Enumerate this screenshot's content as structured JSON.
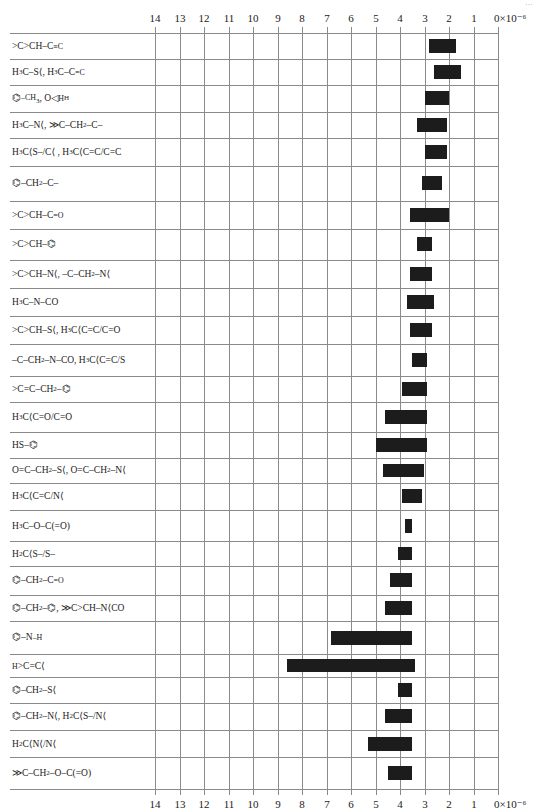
{
  "chart_data": {
    "type": "bar",
    "orientation": "horizontal-range",
    "title": "",
    "xlabel": "×10⁻⁶ (chemical shift scale, reversed)",
    "ylabel": "",
    "xlim": [
      14,
      0
    ],
    "x_unit": "×10⁻⁶",
    "grid": true,
    "ticks": [
      "14",
      "13",
      "12",
      "11",
      "10",
      "9",
      "8",
      "7",
      "6",
      "5",
      "4",
      "3",
      "2",
      "1",
      "0×10⁻⁶"
    ],
    "tick_values": [
      14,
      13,
      12,
      11,
      10,
      9,
      8,
      7,
      6,
      5,
      4,
      3,
      2,
      1,
      0
    ],
    "categories": [
      "(CH3)2CH–C=C",
      "H3C–S, H3C–C=C",
      "C6H5–CH3, epoxide CH2",
      "H3C–N, C=C–CH2–C",
      "H3C–S–C, H3C–C=C",
      "C6H5–CH2–C",
      "(CH3)2CH–C=O",
      "(CH3)2CH–C6H5",
      "(CH3)2CH–N, C–CH2–N",
      "H3C–N–CO",
      "(CH3)2CH–S, H3C–C(=C)–C=O",
      "C–CH2–N–CO, H3C–C(=C)–S",
      "C=C–CH2–C6H5",
      "H3C–C(=O)–C=O",
      "HS–C6H5",
      "O=C–CH2–S, O=C–CH2–N",
      "H3C–C(=C)–N",
      "H3C–O–C(=O)",
      "H2C(S–)(S–)",
      "C6H5–CH2–C=O",
      "C6H5–CH2–C6H5, (CH3)2CH–N–CO",
      "C6H5–NH",
      "H–C=C",
      "C6H5–CH2–S",
      "C6H5–CH2–N, H2C(S)(N)",
      "H2C(N)(N)",
      "C–CH2–O–C(=O)"
    ],
    "ranges": [
      [
        2.8,
        1.7
      ],
      [
        2.6,
        1.5
      ],
      [
        3.0,
        2.0
      ],
      [
        3.3,
        2.1
      ],
      [
        3.0,
        2.1
      ],
      [
        3.1,
        2.3
      ],
      [
        3.6,
        2.0
      ],
      [
        3.3,
        2.7
      ],
      [
        3.6,
        2.7
      ],
      [
        3.7,
        2.6
      ],
      [
        3.6,
        2.7
      ],
      [
        3.5,
        2.9
      ],
      [
        3.9,
        2.9
      ],
      [
        4.6,
        2.9
      ],
      [
        5.0,
        2.9
      ],
      [
        4.7,
        3.0
      ],
      [
        3.9,
        3.1
      ],
      [
        3.8,
        3.5
      ],
      [
        4.1,
        3.5
      ],
      [
        4.4,
        3.5
      ],
      [
        4.6,
        3.5
      ],
      [
        6.8,
        3.5
      ],
      [
        8.6,
        3.4
      ],
      [
        4.1,
        3.5
      ],
      [
        4.6,
        3.5
      ],
      [
        5.3,
        3.5
      ],
      [
        4.5,
        3.5
      ]
    ],
    "row_labels_html": [
      "&gt;C&gt;CH–C<sup>≡C</sup>",
      "H<sub>3</sub>C–S⟨, H<sub>3</sub>C–C<sup>=C</sup>",
      "⌬<sup>–CH<sub>3</sub></sup>, O◁<sup>H</sup><sub>H</sub>",
      "H<sub>3</sub>C–N⟨, ≫C–CH<sub>2</sub>–C–",
      "H<sub>3</sub>C⟨S–/C⟨ , H<sub>3</sub>C⟨C=C/C=C",
      "⌬–CH<sub>2</sub>–C–",
      "&gt;C&gt;CH–C<sup>=O</sup>",
      "&gt;C&gt;CH–⌬",
      "&gt;C&gt;CH–N⟨, –C–CH<sub>2</sub>–N⟨",
      "H<sub>3</sub>C–N–CO",
      "&gt;C&gt;CH–S⟨, H<sub>3</sub>C⟨C=C/C=O",
      "–C–CH<sub>2</sub>–N–CO, H<sub>3</sub>C⟨C=C/S",
      "&gt;C=C–CH<sub>2</sub>–⌬",
      "H<sub>3</sub>C⟨C=O/C=O",
      "HS–⌬",
      "O=C–CH<sub>2</sub>–S⟨, O=C–CH<sub>2</sub>–N⟨",
      "H<sub>3</sub>C⟨C=C/N⟨",
      "H<sub>3</sub>C–O–C(=O)",
      "H<sub>2</sub>C⟨S–/S–",
      "⌬–CH<sub>2</sub>–C<sup>=O</sup>",
      "⌬–CH<sub>2</sub>–⌬, ≫C&gt;CH–N⟨CO",
      "⌬–N<sup>–H</sup>",
      "<sup>H</sup>&gt;C=C⟨",
      "⌬–CH<sub>2</sub>–S⟨",
      "⌬–CH<sub>2</sub>–N⟨, H<sub>2</sub>C⟨S–/N⟨",
      "H<sub>2</sub>C⟨N⟨/N⟨",
      "≫C–CH<sub>2</sub>–O–C(=O)"
    ]
  },
  "layout": {
    "x_zero_px": 498,
    "px_per_unit": 24.5,
    "row_edges_px": [
      32.7,
      58.7,
      85,
      111.7,
      138.3,
      165.7,
      201,
      228.7,
      260,
      287.7,
      315.7,
      344,
      375.7,
      402.3,
      432.3,
      458.3,
      482.7,
      510,
      541,
      566,
      594.7,
      620.7,
      654.3,
      677.3,
      702.7,
      730,
      757.3,
      789.3
    ],
    "bar_color": "#1c1c1c",
    "grid_color": "#8a8a8a"
  },
  "corner_mark": "···"
}
